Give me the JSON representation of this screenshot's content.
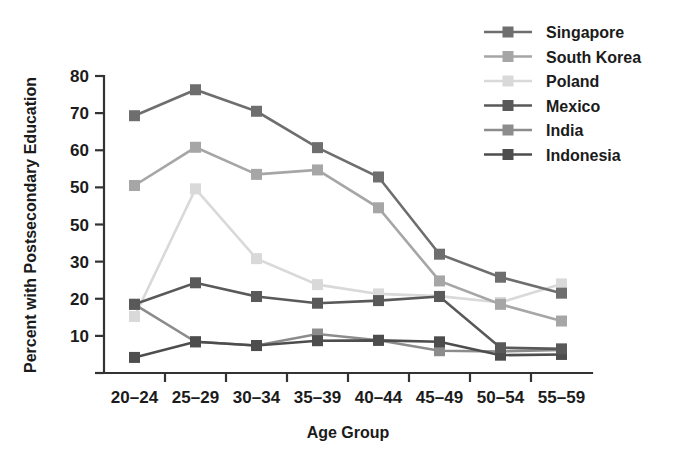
{
  "chart_data": {
    "type": "line",
    "title": "",
    "xlabel": "Age Group",
    "ylabel": "Percent with Postsecondary Education",
    "categories": [
      "20–24",
      "25–29",
      "30–34",
      "35–39",
      "40–44",
      "45–49",
      "50–54",
      "55–59"
    ],
    "ytick_labels": [
      "0",
      "10",
      "20",
      "30",
      "50",
      "50",
      "60",
      "70",
      "80"
    ],
    "ytick_values": [
      0,
      10,
      20,
      30,
      40,
      50,
      60,
      70,
      80
    ],
    "ylim": [
      0,
      80
    ],
    "grid": false,
    "legend_position": "top-right",
    "marker": "square",
    "series": [
      {
        "name": "Singapore",
        "color": "#6e6e6e",
        "values": [
          69.3,
          76.3,
          70.5,
          60.7,
          52.8,
          32.0,
          25.8,
          21.5
        ]
      },
      {
        "name": "South Korea",
        "color": "#a6a6a6",
        "values": [
          50.5,
          60.8,
          53.5,
          54.7,
          44.5,
          24.8,
          18.5,
          14.0
        ]
      },
      {
        "name": "Poland",
        "color": "#d9d9d9",
        "values": [
          15.2,
          49.6,
          30.8,
          23.8,
          21.3,
          20.7,
          19.0,
          24.0
        ]
      },
      {
        "name": "Mexico",
        "color": "#595959",
        "values": [
          18.5,
          24.3,
          20.6,
          18.8,
          19.5,
          20.6,
          6.8,
          6.5
        ]
      },
      {
        "name": "India",
        "color": "#8c8c8c",
        "values": [
          18.5,
          8.4,
          7.4,
          10.5,
          8.8,
          6.0,
          5.8,
          6.2
        ]
      },
      {
        "name": "Indonesia",
        "color": "#4d4d4d",
        "values": [
          4.2,
          8.4,
          7.4,
          8.7,
          8.8,
          8.4,
          4.8,
          5.0
        ]
      }
    ]
  },
  "axes": {
    "y_title": "Percent with Postsecondary Education",
    "x_title": "Age Group"
  },
  "legend": {
    "entries": [
      {
        "label": "Singapore"
      },
      {
        "label": "South Korea"
      },
      {
        "label": "Poland"
      },
      {
        "label": "Mexico"
      },
      {
        "label": "India"
      },
      {
        "label": "Indonesia"
      }
    ]
  }
}
